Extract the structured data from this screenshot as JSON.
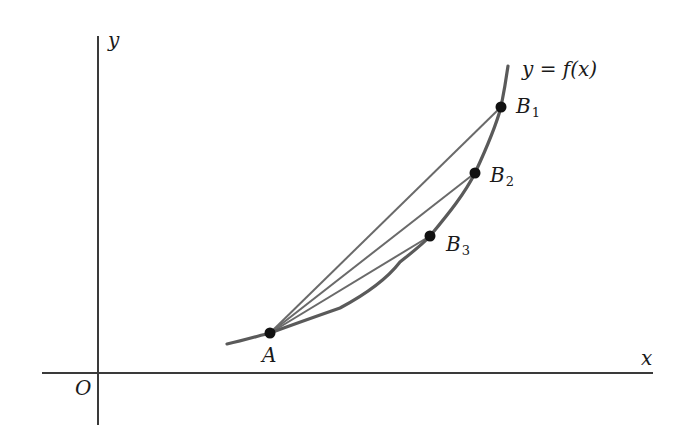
{
  "figure": {
    "axes": {
      "x_label": "x",
      "y_label": "y",
      "origin_label": "O"
    },
    "curve": {
      "label": "y = f(x)",
      "color": "#5a5a5a"
    },
    "points": [
      {
        "id": "A",
        "name": "A",
        "sub": ""
      },
      {
        "id": "B1",
        "name": "B",
        "sub": "1"
      },
      {
        "id": "B2",
        "name": "B",
        "sub": "2"
      },
      {
        "id": "B3",
        "name": "B",
        "sub": "3"
      }
    ],
    "secants": [
      "AB1",
      "AB2",
      "AB3"
    ],
    "colors": {
      "axis": "#3a3a3a",
      "line": "#5f5f5f",
      "point": "#111111"
    }
  }
}
